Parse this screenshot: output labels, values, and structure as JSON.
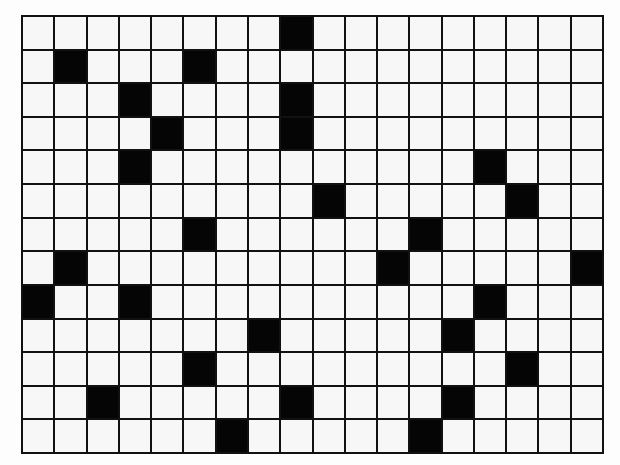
{
  "puzzle": {
    "type": "crossword-grid",
    "rows": 13,
    "cols": 18,
    "colors": {
      "white_cell": "#f7f7f7",
      "black_cell": "#050505",
      "grid_line": "#111111"
    },
    "black_cells": [
      [
        0,
        8
      ],
      [
        1,
        1
      ],
      [
        1,
        5
      ],
      [
        2,
        3
      ],
      [
        2,
        8
      ],
      [
        3,
        4
      ],
      [
        3,
        8
      ],
      [
        4,
        3
      ],
      [
        4,
        14
      ],
      [
        5,
        9
      ],
      [
        5,
        15
      ],
      [
        6,
        5
      ],
      [
        6,
        12
      ],
      [
        7,
        1
      ],
      [
        7,
        11
      ],
      [
        7,
        17
      ],
      [
        8,
        0
      ],
      [
        8,
        3
      ],
      [
        8,
        14
      ],
      [
        9,
        7
      ],
      [
        9,
        13
      ],
      [
        10,
        5
      ],
      [
        10,
        15
      ],
      [
        11,
        2
      ],
      [
        11,
        8
      ],
      [
        11,
        13
      ],
      [
        12,
        6
      ],
      [
        12,
        12
      ]
    ]
  }
}
